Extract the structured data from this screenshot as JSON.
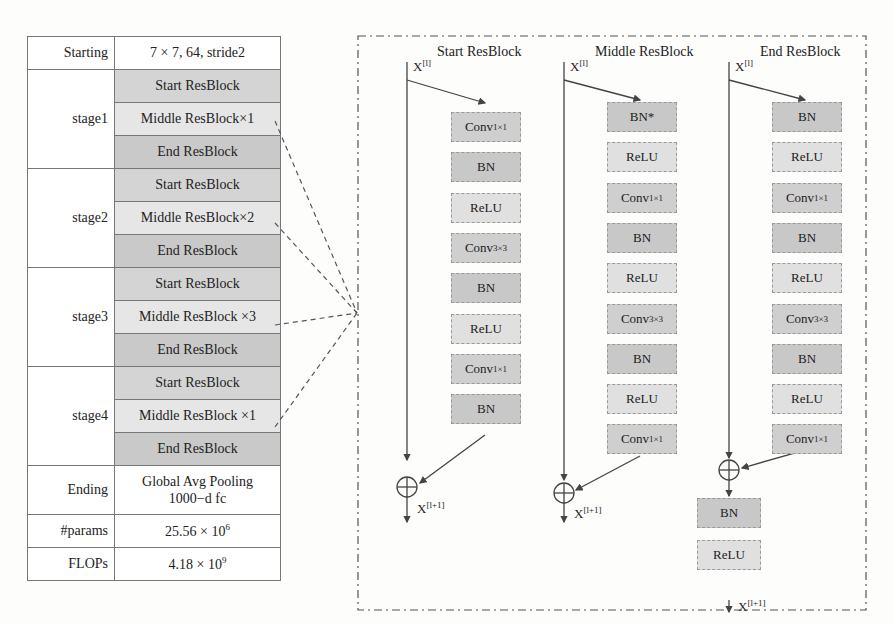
{
  "table": {
    "starting": {
      "label": "Starting",
      "value": "7 × 7,  64,  stride2"
    },
    "stages": [
      {
        "label": "stage1",
        "blocks": [
          "Start ResBlock",
          "Middle ResBlock×1",
          "End ResBlock"
        ]
      },
      {
        "label": "stage2",
        "blocks": [
          "Start ResBlock",
          "Middle ResBlock×2",
          "End ResBlock"
        ]
      },
      {
        "label": "stage3",
        "blocks": [
          "Start ResBlock",
          "Middle ResBlock ×3",
          "End ResBlock"
        ]
      },
      {
        "label": "stage4",
        "blocks": [
          "Start ResBlock",
          "Middle ResBlock ×1",
          "End ResBlock"
        ]
      }
    ],
    "ending": {
      "label": "Ending",
      "line1": "Global Avg Pooling",
      "line2": "1000−d fc"
    },
    "params": {
      "label": "#params",
      "value": "25.56 × 10",
      "exp": "6"
    },
    "flops": {
      "label": "FLOPs",
      "value": "4.18 × 10",
      "exp": "9"
    }
  },
  "diagram": {
    "input_label": "X",
    "input_sup": "[l]",
    "output_sup": "[l+1]",
    "start": {
      "title": "Start ResBlock",
      "layers": [
        "Conv",
        "BN",
        "ReLU",
        "Conv",
        "BN",
        "ReLU",
        "Conv",
        "BN"
      ],
      "subs": [
        "1×1",
        "",
        "",
        "3×3",
        "",
        "",
        "1×1",
        ""
      ]
    },
    "middle": {
      "title": "Middle ResBlock",
      "layers": [
        "BN*",
        "ReLU",
        "Conv",
        "BN",
        "ReLU",
        "Conv",
        "BN",
        "ReLU",
        "Conv"
      ],
      "subs": [
        "",
        "",
        "1×1",
        "",
        "",
        "3×3",
        "",
        "",
        "1×1"
      ]
    },
    "end": {
      "title": "End ResBlock",
      "layers": [
        "BN",
        "ReLU",
        "Conv",
        "BN",
        "ReLU",
        "Conv",
        "BN",
        "ReLU",
        "Conv"
      ],
      "subs": [
        "",
        "",
        "1×1",
        "",
        "",
        "3×3",
        "",
        "",
        "1×1"
      ],
      "post": [
        "BN",
        "ReLU"
      ]
    }
  }
}
